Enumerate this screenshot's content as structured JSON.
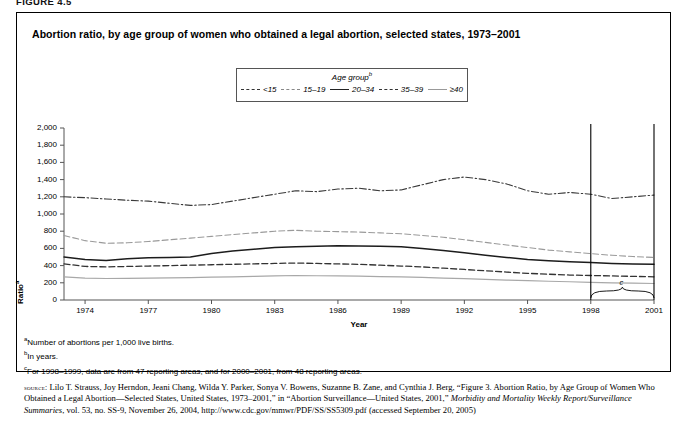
{
  "figure": {
    "label": "FIGURE 4.5",
    "title": "Abortion ratio, by age group of women who obtained a legal abortion, selected states, 1973–2001"
  },
  "legend": {
    "title": "Age group",
    "title_sup": "b",
    "items": [
      {
        "label": "<15",
        "style": "dash-dot",
        "color": "#333333",
        "name": "legend-item-lt15"
      },
      {
        "label": "15–19",
        "style": "dashed-light",
        "color": "#888888",
        "name": "legend-item-15-19"
      },
      {
        "label": "20–34",
        "style": "solid-dark",
        "color": "#222222",
        "name": "legend-item-20-34"
      },
      {
        "label": "35–39",
        "style": "dashed-dark",
        "color": "#333333",
        "name": "legend-item-35-39"
      },
      {
        "label": "≥40",
        "style": "solid-light",
        "color": "#999999",
        "name": "legend-item-40plus"
      }
    ]
  },
  "axes": {
    "ylabel": "Ratio",
    "ylabel_sup": "a",
    "xlabel": "Year",
    "yticks": [
      "2,000",
      "1,800",
      "1,600",
      "1,400",
      "1,200",
      "1,000",
      "800",
      "600",
      "400",
      "200",
      "0"
    ],
    "xticks": [
      "1974",
      "1977",
      "1980",
      "1983",
      "1986",
      "1989",
      "1992",
      "1995",
      "1998",
      "2001"
    ]
  },
  "annotations": {
    "brace_label": "c"
  },
  "footnotes": [
    {
      "sup": "a",
      "text": "Number of abortions per 1,000 live births."
    },
    {
      "sup": "b",
      "text": "In years."
    },
    {
      "sup": "c",
      "text": "For 1998–1999, data are from 47 reporting areas, and for 2000–2001, from 48 reporting areas."
    }
  ],
  "source": {
    "prefix": "source:",
    "part1": " Lilo T. Strauss, Joy Herndon, Jeani Chang, Wilda Y. Parker, Sonya V. Bowens, Suzanne B. Zane, and Cynthia J. Berg, “Figure 3. Abortion Ratio, by Age Group of Women Who Obtained a Legal Abortion—Selected States, United States, 1973–2001,” in “Abortion Surveillance—United States, 2001,” ",
    "italic": "Morbidity and Mortality Weekly Report/Surveillance Summaries",
    "part2": ", vol. 53, no. SS-9, November 26, 2004, http://www.cdc.gov/mmwr/PDF/SS/SS5309.pdf (accessed September 20, 2005)"
  },
  "chart_data": {
    "type": "line",
    "title": "Abortion ratio, by age group of women who obtained a legal abortion, selected states, 1973–2001",
    "xlabel": "Year",
    "ylabel": "Ratio",
    "xlim": [
      1973,
      2001
    ],
    "ylim": [
      0,
      2000
    ],
    "ytick_step": 200,
    "grid": false,
    "legend_position": "top-center",
    "x": [
      1973,
      1974,
      1975,
      1976,
      1977,
      1978,
      1979,
      1980,
      1981,
      1982,
      1983,
      1984,
      1985,
      1986,
      1987,
      1988,
      1989,
      1990,
      1991,
      1992,
      1993,
      1994,
      1995,
      1996,
      1997,
      1998,
      1999,
      2000,
      2001
    ],
    "series": [
      {
        "name": "<15",
        "linestyle": "dash-dot",
        "values": [
          1200,
          1190,
          1175,
          1160,
          1150,
          1125,
          1100,
          1110,
          1150,
          1190,
          1230,
          1270,
          1260,
          1290,
          1300,
          1270,
          1280,
          1340,
          1400,
          1430,
          1400,
          1350,
          1270,
          1230,
          1250,
          1230,
          1180,
          1200,
          1220
        ]
      },
      {
        "name": "15–19",
        "linestyle": "dashed",
        "values": [
          750,
          690,
          660,
          665,
          680,
          700,
          720,
          740,
          760,
          780,
          800,
          810,
          800,
          795,
          790,
          780,
          770,
          750,
          730,
          700,
          670,
          640,
          610,
          580,
          560,
          540,
          520,
          505,
          495
        ]
      },
      {
        "name": "20–34",
        "linestyle": "solid",
        "values": [
          500,
          470,
          460,
          480,
          490,
          495,
          500,
          540,
          570,
          590,
          610,
          620,
          625,
          630,
          628,
          625,
          620,
          600,
          575,
          550,
          520,
          495,
          470,
          455,
          445,
          435,
          425,
          420,
          415
        ]
      },
      {
        "name": "35–39",
        "linestyle": "dashed",
        "values": [
          420,
          390,
          385,
          390,
          395,
          400,
          405,
          410,
          415,
          420,
          425,
          430,
          425,
          420,
          415,
          405,
          395,
          385,
          370,
          355,
          340,
          325,
          310,
          300,
          290,
          285,
          280,
          275,
          270
        ]
      },
      {
        "name": "≥40",
        "linestyle": "solid",
        "values": [
          270,
          255,
          250,
          252,
          255,
          258,
          260,
          265,
          270,
          275,
          280,
          285,
          282,
          280,
          278,
          272,
          268,
          262,
          255,
          248,
          240,
          232,
          225,
          218,
          212,
          206,
          200,
          196,
          192
        ]
      }
    ]
  }
}
